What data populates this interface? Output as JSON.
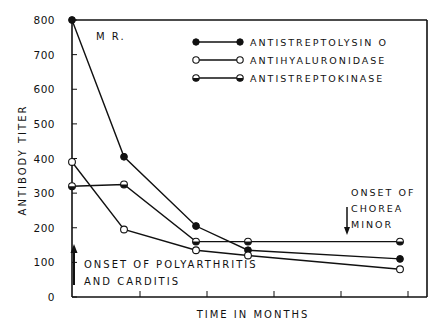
{
  "chart_data": {
    "type": "line",
    "title": "",
    "panel_label": "M R.",
    "xlabel": "TIME IN MONTHS",
    "ylabel": "ANTIBODY TITER",
    "ylim": [
      0,
      800
    ],
    "yticks": [
      0,
      100,
      200,
      300,
      400,
      500,
      600,
      700,
      800
    ],
    "ytick_labels": [
      "0",
      "100",
      "200",
      "300",
      "400",
      "500",
      "600",
      "700",
      "800"
    ],
    "x": [
      0,
      1,
      2.4,
      3.4,
      6.3
    ],
    "xticks_unlabeled": true,
    "grid": false,
    "legend_position": "upper right",
    "series": [
      {
        "name": "ANTISTREPTOLYSIN O",
        "marker": "filled-circle",
        "values": [
          800,
          405,
          205,
          135,
          110
        ]
      },
      {
        "name": "ANTIHYALURONIDASE",
        "marker": "open-circle",
        "values": [
          390,
          195,
          135,
          120,
          80
        ]
      },
      {
        "name": "ANTISTREPTOKINASE",
        "marker": "half-filled-circle",
        "values": [
          320,
          325,
          160,
          160,
          160
        ]
      }
    ],
    "annotations": [
      {
        "text": [
          "ONSET OF POLYARTHRITIS",
          "AND CARDITIS"
        ],
        "arrow": "up",
        "at_x": 0
      },
      {
        "text": [
          "ONSET OF",
          "CHOREA",
          "MINOR"
        ],
        "arrow": "down",
        "at_x": 5.6
      }
    ]
  },
  "axis": {
    "ylabel": "ANTIBODY TITER",
    "xlabel": "TIME IN MONTHS",
    "yticks": [
      "0",
      "100",
      "200",
      "300",
      "400",
      "500",
      "600",
      "700",
      "800"
    ]
  },
  "legend": {
    "items": [
      {
        "label": "ANTISTREPTOLYSIN O"
      },
      {
        "label": "ANTIHYALURONIDASE"
      },
      {
        "label": "ANTISTREPTOKINASE"
      }
    ]
  },
  "labels": {
    "panel": "M R.",
    "onset1_line1": "ONSET OF POLYARTHRITIS",
    "onset1_line2": "AND CARDITIS",
    "onset2_line1": "ONSET OF",
    "onset2_line2": "CHOREA",
    "onset2_line3": "MINOR"
  }
}
